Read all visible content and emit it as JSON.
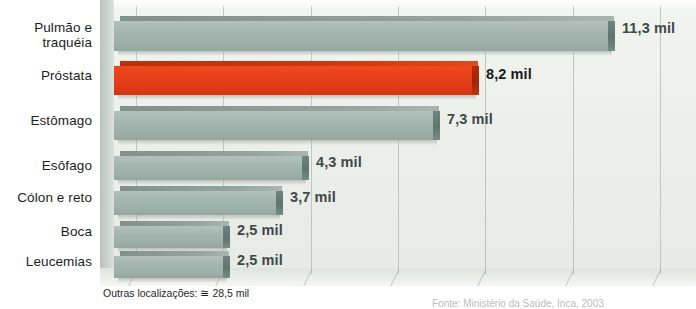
{
  "chart_data": {
    "type": "bar",
    "orientation": "horizontal",
    "title": "",
    "subtitle": "",
    "xlabel": "",
    "ylabel": "",
    "unit_suffix": "mil",
    "categories": [
      "Pulmão e traquéia",
      "Próstata",
      "Estômago",
      "Esôfago",
      "Cólon e reto",
      "Boca",
      "Leucemias"
    ],
    "values": [
      11.3,
      8.2,
      7.3,
      4.3,
      3.7,
      2.5,
      2.5
    ],
    "value_labels": [
      "11,3 mil",
      "8,2 mil",
      "7,3 mil",
      "4,3 mil",
      "3,7 mil",
      "2,5 mil",
      "2,5 mil"
    ],
    "highlight_index": 1,
    "xlim": [
      0,
      14
    ],
    "grid": true,
    "gridline_values": [
      1,
      3,
      5,
      7,
      9,
      11,
      13
    ],
    "legend": "none",
    "colors": {
      "bar": "#a4b5af",
      "bar_cap": "#5d746f",
      "highlight_bar": "#e8401a",
      "highlight_cap": "#9e2505",
      "plot_background": "#eceee9",
      "gridline": "#9aa5a0",
      "label_text": "#1c1c1c",
      "value_text": "#3c4a46"
    }
  },
  "footnote": {
    "text": "Outras localizações: ≅ 28,5 mil"
  },
  "source": {
    "text": "Fonte: Ministério da Saúde, Inca, 2003"
  }
}
